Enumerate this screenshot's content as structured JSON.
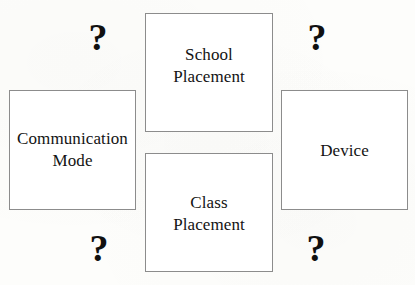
{
  "diagram": {
    "type": "relationship-diagram",
    "background_color": "#fdfdfb",
    "box_border_color": "#8c8c8c",
    "box_fill_color": "#ffffff",
    "text_color": "#131313",
    "nodes": [
      {
        "id": "communication-mode",
        "label": "Communication\nMode"
      },
      {
        "id": "school-placement",
        "label": "School\nPlacement"
      },
      {
        "id": "class-placement",
        "label": "Class\nPlacement"
      },
      {
        "id": "device",
        "label": "Device"
      }
    ],
    "connectors": [
      {
        "id": "top-left",
        "symbol": "?"
      },
      {
        "id": "top-right",
        "symbol": "?"
      },
      {
        "id": "bottom-left",
        "symbol": "?"
      },
      {
        "id": "bottom-right",
        "symbol": "?"
      }
    ]
  }
}
